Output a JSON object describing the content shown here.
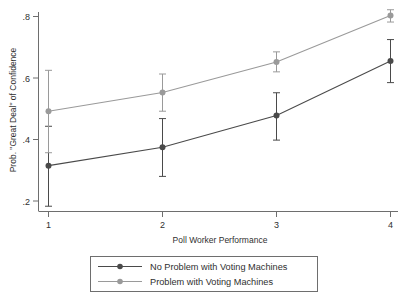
{
  "chart_data": {
    "type": "line",
    "title": "",
    "subtitle": "",
    "xlabel": "Poll Worker Performance",
    "ylabel": "Prob. \"Great Deal\" of Confidence",
    "x": [
      1,
      2,
      3,
      4
    ],
    "xtick_labels": [
      "1",
      "2",
      "3",
      "4"
    ],
    "ytick_labels": [
      ".2",
      ".4",
      ".6",
      ".8"
    ],
    "ytick_values": [
      0.2,
      0.4,
      0.6,
      0.8
    ],
    "xlim": [
      0.72,
      4.28
    ],
    "ylim": [
      0.155,
      0.83
    ],
    "grid": false,
    "legend_position": "below-plot",
    "error_bars": "vertical-capped-95ci",
    "series": [
      {
        "name": "No Problem with Voting Machines",
        "color": "#4a4a4a",
        "marker": "filled-circle",
        "values": [
          0.315,
          0.375,
          0.478,
          0.655
        ],
        "ci_low": [
          0.183,
          0.28,
          0.398,
          0.585
        ],
        "ci_high": [
          0.443,
          0.468,
          0.552,
          0.725
        ]
      },
      {
        "name": "Problem with Voting Machines",
        "color": "#9a9a9a",
        "marker": "filled-circle",
        "values": [
          0.492,
          0.553,
          0.652,
          0.803
        ],
        "ci_low": [
          0.357,
          0.492,
          0.62,
          0.782
        ],
        "ci_high": [
          0.625,
          0.613,
          0.685,
          0.822
        ]
      }
    ]
  },
  "legend": {
    "entries": [
      {
        "label": "No Problem with Voting Machines",
        "color": "#4a4a4a"
      },
      {
        "label": "Problem with Voting Machines",
        "color": "#9a9a9a"
      }
    ]
  },
  "axes": {
    "y_title": "Prob. \"Great Deal\" of Confidence",
    "x_title": "Poll Worker Performance"
  }
}
